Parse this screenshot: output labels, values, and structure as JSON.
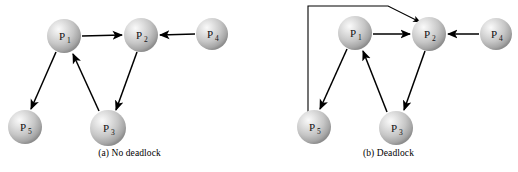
{
  "figure": {
    "width": 518,
    "height": 172,
    "background_color": "#ffffff",
    "line_color": "#000000",
    "node_fill_light": "#f2f2f2",
    "node_fill_mid": "#c9c9c9",
    "node_fill_dark": "#8f8f8f"
  },
  "panels": [
    {
      "id": "panel-a",
      "caption": "(a) No deadlock",
      "nodes": [
        {
          "id": "P1",
          "label": "P",
          "sub": "1",
          "cx": 64,
          "cy": 36,
          "r": 17
        },
        {
          "id": "P2",
          "label": "P",
          "sub": "2",
          "cx": 141,
          "cy": 35,
          "r": 17
        },
        {
          "id": "P4",
          "label": "P",
          "sub": "4",
          "cx": 212,
          "cy": 34,
          "r": 16
        },
        {
          "id": "P5",
          "label": "P",
          "sub": "5",
          "cx": 25,
          "cy": 127,
          "r": 17
        },
        {
          "id": "P3",
          "label": "P",
          "sub": "3",
          "cx": 108,
          "cy": 128,
          "r": 18
        }
      ],
      "edges": [
        {
          "from": "P1",
          "to": "P2"
        },
        {
          "from": "P4",
          "to": "P2"
        },
        {
          "from": "P1",
          "to": "P5"
        },
        {
          "from": "P3",
          "to": "P1"
        },
        {
          "from": "P2",
          "to": "P3"
        }
      ]
    },
    {
      "id": "panel-b",
      "caption": "(b) Deadlock",
      "nodes": [
        {
          "id": "P1",
          "label": "P",
          "sub": "1",
          "cx": 96,
          "cy": 33,
          "r": 17
        },
        {
          "id": "P2",
          "label": "P",
          "sub": "2",
          "cx": 170,
          "cy": 34,
          "r": 17
        },
        {
          "id": "P4",
          "label": "P",
          "sub": "4",
          "cx": 237,
          "cy": 34,
          "r": 16
        },
        {
          "id": "P5",
          "label": "P",
          "sub": "5",
          "cx": 55,
          "cy": 127,
          "r": 17
        },
        {
          "id": "P3",
          "label": "P",
          "sub": "3",
          "cx": 137,
          "cy": 128,
          "r": 17
        }
      ],
      "edges": [
        {
          "from": "P1",
          "to": "P2"
        },
        {
          "from": "P4",
          "to": "P2"
        },
        {
          "from": "P1",
          "to": "P5"
        },
        {
          "from": "P3",
          "to": "P1"
        },
        {
          "from": "P2",
          "to": "P3"
        },
        {
          "from": "P5",
          "to": "P2",
          "routing": "orthogonal-top"
        }
      ]
    }
  ]
}
